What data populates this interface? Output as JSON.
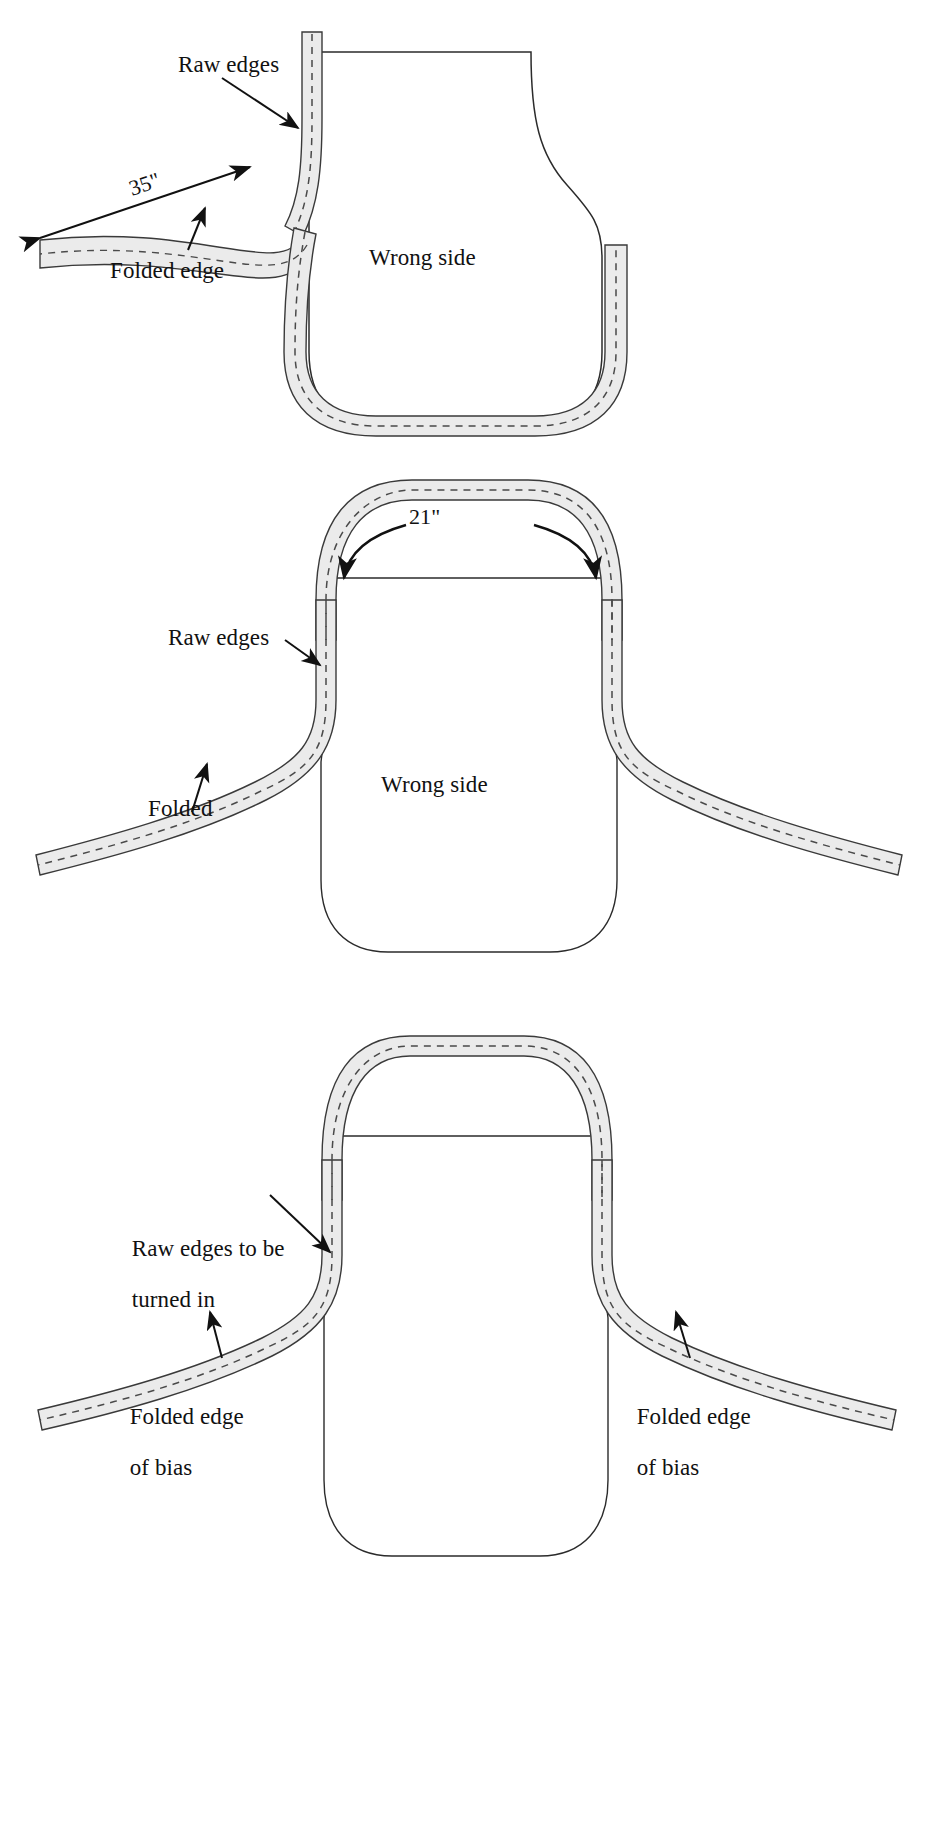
{
  "figure": {
    "kind": "sewing-instruction-diagram",
    "panel_count": 3,
    "background_color": "#ffffff",
    "ink_color": "#1a1a1a",
    "bias_fill_color": "#ebebeb",
    "bias_stroke_color": "#3a3a3a",
    "stitch_line_color": "#4a4a4a",
    "body_outline_color": "#2b2b2b"
  },
  "panels": [
    {
      "id": "panel-1",
      "index": 1,
      "labels": {
        "raw_edges": "Raw edges",
        "folded_edge": "Folded edge",
        "wrong_side": "Wrong side",
        "measurement": "35\""
      },
      "annotations": [
        {
          "name": "raw-edges-label",
          "text": "Raw edges",
          "arrow": "points down-right to bias tape on neck curve"
        },
        {
          "name": "folded-edge-label",
          "text": "Folded edge",
          "arrow": "points up-right to lower folded edge of bias strip"
        },
        {
          "name": "length-dimension",
          "text": "35\"",
          "arrow": "double-headed along bias tie strip"
        },
        {
          "name": "wrong-side-label",
          "text": "Wrong side",
          "arrow": "none"
        }
      ]
    },
    {
      "id": "panel-2",
      "index": 2,
      "labels": {
        "raw_edges": "Raw edges",
        "folded": "Folded",
        "wrong_side": "Wrong side",
        "measurement": "21\""
      },
      "annotations": [
        {
          "name": "neck-dimension",
          "text": "21\"",
          "arrow": "two curved arrows sweeping down both sides of neck loop"
        },
        {
          "name": "raw-edges-label",
          "text": "Raw edges",
          "arrow": "points down-right to bias at left armhole curve"
        },
        {
          "name": "folded-label",
          "text": "Folded",
          "arrow": "points up-right to lower folded edge of left tie"
        },
        {
          "name": "wrong-side-label",
          "text": "Wrong side",
          "arrow": "none"
        }
      ]
    },
    {
      "id": "panel-3",
      "index": 3,
      "labels": {
        "raw_edges_to_be_turned_in": "Raw edges to be\nturned in",
        "raw_edges_line_1": "Raw edges to be",
        "raw_edges_line_2": "turned in",
        "folded_edge_of_bias_left_line_1": "Folded edge",
        "folded_edge_of_bias_left_line_2": "of bias",
        "folded_edge_of_bias_right_line_1": "Folded edge",
        "folded_edge_of_bias_right_line_2": "of bias"
      },
      "annotations": [
        {
          "name": "raw-edges-turned-in-label",
          "text": "Raw edges to be turned in",
          "arrow": "points down-right to left armhole bias"
        },
        {
          "name": "folded-edge-bias-left-label",
          "text": "Folded edge of bias",
          "arrow": "points up-right to left tie folded edge"
        },
        {
          "name": "folded-edge-bias-right-label",
          "text": "Folded edge of bias",
          "arrow": "points up-left to right tie folded edge"
        }
      ]
    }
  ]
}
